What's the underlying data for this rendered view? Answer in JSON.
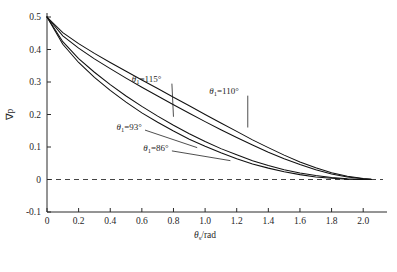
{
  "chart_data": {
    "type": "line",
    "title": "",
    "xlabel": "θs/rad",
    "xlabel_parts": {
      "symbol": "θ",
      "sub": "s",
      "rest": "/rad"
    },
    "ylabel": "∇p",
    "xlim": [
      0,
      2.1
    ],
    "ylim": [
      -0.1,
      0.5
    ],
    "xticks": [
      0,
      0.2,
      0.4,
      0.6,
      0.8,
      1.0,
      1.2,
      1.4,
      1.6,
      1.8,
      2.0
    ],
    "xticklabels": [
      "0",
      "0.2",
      "0.4",
      "0.6",
      "0.8",
      "1.0",
      "1.2",
      "1.4",
      "1.6",
      "1.8",
      "2.0"
    ],
    "yticks": [
      -0.1,
      0,
      0.1,
      0.2,
      0.3,
      0.4,
      0.5
    ],
    "yticklabels": [
      "-0.1",
      "0",
      "0.1",
      "0.2",
      "0.3",
      "0.4",
      "0.5"
    ],
    "grid": false,
    "legend_position": "inline-annotations",
    "reference_lines": [
      {
        "axis": "y",
        "value": 0,
        "style": "dashed"
      }
    ],
    "annotations": [
      {
        "id": "c115",
        "text": "θ1=115°",
        "symbol": "θ",
        "sub": "1",
        "value": "115°",
        "x": 0.63,
        "y": 0.285
      },
      {
        "id": "c110",
        "text": "θ1=110°",
        "symbol": "θ",
        "sub": "1",
        "value": "110°",
        "x": 1.11,
        "y": 0.245
      },
      {
        "id": "c93",
        "text": "θ1=93°",
        "symbol": "θ",
        "sub": "1",
        "value": "93°",
        "x": 0.33,
        "y": 0.145
      },
      {
        "id": "c86",
        "text": "θ1=86°",
        "symbol": "θ",
        "sub": "1",
        "value": "86°",
        "x": 0.46,
        "y": 0.082
      }
    ],
    "series": [
      {
        "name": "θ1=115°",
        "theta1_deg": 115,
        "x": [
          0,
          0.1,
          0.2,
          0.3,
          0.4,
          0.5,
          0.6,
          0.7,
          0.8,
          0.9,
          1.0,
          1.1,
          1.2,
          1.3,
          1.4,
          1.5,
          1.6,
          1.7,
          1.8,
          1.9,
          2.0,
          2.05
        ],
        "values": [
          0.5,
          0.452,
          0.418,
          0.388,
          0.36,
          0.333,
          0.306,
          0.28,
          0.253,
          0.227,
          0.2,
          0.174,
          0.148,
          0.122,
          0.098,
          0.075,
          0.054,
          0.036,
          0.021,
          0.01,
          0.003,
          0.001
        ]
      },
      {
        "name": "θ1=110°",
        "theta1_deg": 110,
        "x": [
          0,
          0.1,
          0.2,
          0.3,
          0.4,
          0.5,
          0.6,
          0.7,
          0.8,
          0.9,
          1.0,
          1.1,
          1.2,
          1.3,
          1.4,
          1.5,
          1.6,
          1.7,
          1.8,
          1.9,
          2.0,
          2.05
        ],
        "values": [
          0.5,
          0.442,
          0.404,
          0.371,
          0.341,
          0.312,
          0.284,
          0.257,
          0.23,
          0.204,
          0.178,
          0.153,
          0.129,
          0.106,
          0.084,
          0.064,
          0.046,
          0.03,
          0.017,
          0.008,
          0.002,
          0.001
        ]
      },
      {
        "name": "θ1=93°",
        "theta1_deg": 93,
        "x": [
          0,
          0.1,
          0.2,
          0.3,
          0.4,
          0.5,
          0.6,
          0.7,
          0.8,
          0.9,
          1.0,
          1.1,
          1.2,
          1.3,
          1.4,
          1.5,
          1.6,
          1.7,
          1.8,
          1.9,
          2.0,
          2.05
        ],
        "values": [
          0.5,
          0.424,
          0.372,
          0.33,
          0.292,
          0.257,
          0.225,
          0.195,
          0.167,
          0.141,
          0.117,
          0.095,
          0.076,
          0.058,
          0.043,
          0.03,
          0.02,
          0.012,
          0.006,
          0.002,
          0.0,
          0.0
        ]
      },
      {
        "name": "θ1=86°",
        "theta1_deg": 86,
        "x": [
          0,
          0.1,
          0.2,
          0.3,
          0.4,
          0.5,
          0.6,
          0.7,
          0.8,
          0.9,
          1.0,
          1.1,
          1.2,
          1.3,
          1.4,
          1.5,
          1.6,
          1.7,
          1.8,
          1.9,
          2.0,
          2.05
        ],
        "values": [
          0.5,
          0.416,
          0.36,
          0.314,
          0.274,
          0.238,
          0.205,
          0.176,
          0.149,
          0.124,
          0.102,
          0.082,
          0.064,
          0.048,
          0.035,
          0.024,
          0.015,
          0.008,
          0.004,
          0.001,
          0.0,
          0.0
        ]
      }
    ],
    "colors": {
      "curve": "#111111",
      "axis": "#2b2b2b",
      "reference": "#444444",
      "background": "#ffffff"
    }
  }
}
